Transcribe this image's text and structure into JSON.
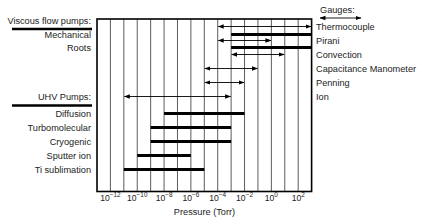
{
  "diagram": {
    "xlabel": "Pressure (Torr)",
    "x_scale": "log10",
    "x_range_exponents": [
      -13,
      3
    ],
    "tick_exponents": [
      -12,
      -10,
      -8,
      -6,
      -4,
      -2,
      0,
      2
    ],
    "tick_base": "10",
    "gridline_exponents": [
      -12,
      -11,
      -10,
      -9,
      -8,
      -7,
      -6,
      -5,
      -4,
      -3,
      -2,
      -1,
      0,
      1,
      2
    ],
    "sections": {
      "viscous": {
        "title": "Viscous flow pumps:"
      },
      "uhv": {
        "title": "UHV Pumps:"
      },
      "gauges": {
        "title": "Gauges:"
      }
    },
    "pumps": [
      {
        "name": "Mechanical",
        "group": "viscous",
        "from_exp": -3,
        "to_exp": 3
      },
      {
        "name": "Roots",
        "group": "viscous",
        "from_exp": -3,
        "to_exp": 3
      },
      {
        "name": "Diffusion",
        "group": "uhv",
        "from_exp": -8,
        "to_exp": -2
      },
      {
        "name": "Turbomolecular",
        "group": "uhv",
        "from_exp": -9,
        "to_exp": -3
      },
      {
        "name": "Cryogenic",
        "group": "uhv",
        "from_exp": -9,
        "to_exp": -3
      },
      {
        "name": "Sputter ion",
        "group": "uhv",
        "from_exp": -10,
        "to_exp": -6
      },
      {
        "name": "Ti sublimation",
        "group": "uhv",
        "from_exp": -11,
        "to_exp": -5
      }
    ],
    "gauges": [
      {
        "name": "Thermocouple",
        "from_exp": -4,
        "to_exp": 3
      },
      {
        "name": "Pirani",
        "from_exp": -4,
        "to_exp": 0
      },
      {
        "name": "Convection",
        "from_exp": -3,
        "to_exp": 1
      },
      {
        "name": "Capacitance Manometer",
        "from_exp": -5,
        "to_exp": -1
      },
      {
        "name": "Penning",
        "from_exp": -5,
        "to_exp": -2
      },
      {
        "name": "Ion",
        "from_exp": -11,
        "to_exp": -3
      }
    ],
    "colors": {
      "line": "#000000",
      "text": "#222222",
      "grid": "#333333"
    }
  }
}
